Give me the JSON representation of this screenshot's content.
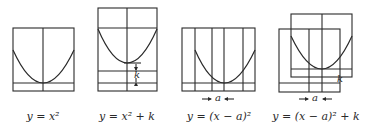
{
  "figure": {
    "panels": [
      {
        "id": "base",
        "caption": "y = x²",
        "annotations": []
      },
      {
        "id": "vertical-shift",
        "caption": "y = x² + k",
        "annotations": [
          "k"
        ]
      },
      {
        "id": "horizontal-shift",
        "caption": "y = (x − a)²",
        "annotations": [
          "a"
        ]
      },
      {
        "id": "combined-shift",
        "caption": "y = (x − a)² + k",
        "annotations": [
          "a",
          "k"
        ]
      }
    ]
  },
  "colors": {
    "ink": "#2a2a2a",
    "background": "#ffffff"
  }
}
